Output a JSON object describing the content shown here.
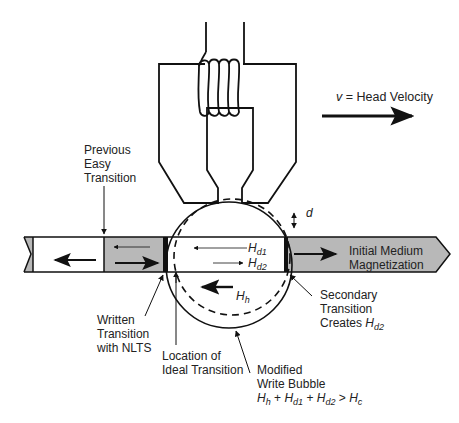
{
  "diagram": {
    "velocity": {
      "symbol": "v",
      "label": " = Head Velocity",
      "direction": "right"
    },
    "labels": {
      "previous_easy_transition": [
        "Previous",
        "Easy",
        "Transition"
      ],
      "written_transition": [
        "Written",
        "Transition",
        "with NLTS"
      ],
      "ideal_transition": [
        "Location of",
        "Ideal Transition"
      ],
      "modified_write_bubble": [
        "Modified",
        "Write Bubble"
      ],
      "bubble_condition": {
        "terms": [
          {
            "sym": "H",
            "sub": "h"
          },
          {
            "sym": "H",
            "sub": "d1"
          },
          {
            "sym": "H",
            "sub": "d2"
          },
          {
            "sym": "H",
            "sub": "c"
          }
        ],
        "ops": [
          "+",
          "+",
          ">"
        ]
      },
      "secondary_transition": [
        "Secondary",
        "Transition",
        "Creates "
      ],
      "secondary_field": {
        "sym": "H",
        "sub": "d2"
      },
      "initial_medium": [
        "Initial Medium",
        "Magnetization"
      ],
      "spacing": "d"
    },
    "fields": [
      {
        "sym": "H",
        "sub": "d1",
        "direction": "left"
      },
      {
        "sym": "H",
        "sub": "d2",
        "direction": "right"
      },
      {
        "sym": "H",
        "sub": "h",
        "direction": "left"
      }
    ],
    "medium_regions": [
      {
        "name": "old-bit",
        "fill": "#ffffff",
        "magnetization": "left"
      },
      {
        "name": "previous-bit",
        "fill": "#b8b8b8",
        "magnetization": "right",
        "weak_reverse": "left"
      },
      {
        "name": "bubble-region",
        "fill": "#ffffff"
      },
      {
        "name": "initial-medium",
        "fill": "#b8b8b8",
        "magnetization": "right"
      }
    ],
    "colors": {
      "stroke": "#111111",
      "gray_fill": "#b8b8b8",
      "text": "#222222"
    }
  }
}
